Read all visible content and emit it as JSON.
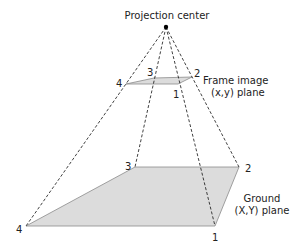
{
  "title": "Projection center",
  "colors": {
    "plane_fill": "#dcdcdc",
    "plane_stroke": "#8a8a8a",
    "ray_stroke": "#111111",
    "text": "#222222",
    "center_dot": "#000000"
  },
  "projection_center": {
    "label": "Projection center",
    "x": 166,
    "y": 27
  },
  "frame_plane": {
    "label_line1": "Frame image",
    "label_line2": "(x,y) plane",
    "corners": [
      {
        "id": "1",
        "x": 178,
        "y": 84
      },
      {
        "id": "2",
        "x": 192,
        "y": 77
      },
      {
        "id": "3",
        "x": 154,
        "y": 78
      },
      {
        "id": "4",
        "x": 126,
        "y": 84
      }
    ]
  },
  "ground_plane": {
    "label_line1": "Ground",
    "label_line2": "(X,Y) plane",
    "corners": [
      {
        "id": "1",
        "x": 215,
        "y": 226
      },
      {
        "id": "2",
        "x": 239,
        "y": 167
      },
      {
        "id": "3",
        "x": 135,
        "y": 167
      },
      {
        "id": "4",
        "x": 26,
        "y": 226
      }
    ]
  },
  "corner_labels": {
    "frame_1": "1",
    "frame_2": "2",
    "frame_3": "3",
    "frame_4": "4",
    "ground_1": "1",
    "ground_2": "2",
    "ground_3": "3",
    "ground_4": "4"
  }
}
